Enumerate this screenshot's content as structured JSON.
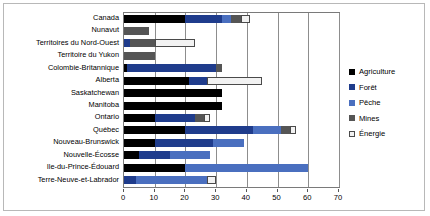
{
  "chart_data": {
    "type": "bar",
    "orientation": "horizontal",
    "stacked": true,
    "title": "",
    "xlabel": "",
    "ylabel": "",
    "xlim": [
      0,
      70
    ],
    "xticks": [
      0,
      10,
      20,
      30,
      40,
      50,
      60,
      70
    ],
    "grid": true,
    "legend_position": "right",
    "categories": [
      "Canada",
      "Nunavut",
      "Territoires du Nord-Ouest",
      "Territoire du Yukon",
      "Colombie-Britannique",
      "Alberta",
      "Saskatchewan",
      "Manitoba",
      "Ontario",
      "Québec",
      "Nouveau-Brunswick",
      "Nouvelle-Écosse",
      "Ile-du-Prince-Édouard",
      "Terre-Neuve-et-Labrador"
    ],
    "series": [
      {
        "name": "Agriculture",
        "color": "#000000",
        "values": [
          20,
          0,
          0,
          0,
          1,
          21,
          32,
          32,
          10,
          20,
          10,
          5,
          20,
          0
        ]
      },
      {
        "name": "Forêt",
        "color": "#1f3c8c",
        "values": [
          12,
          0,
          2,
          0,
          29,
          6,
          0,
          0,
          13,
          22,
          19,
          10,
          0,
          4
        ]
      },
      {
        "name": "Pêche",
        "color": "#4a6fbf",
        "values": [
          3,
          0,
          0,
          0,
          0,
          0,
          0,
          0,
          0,
          9,
          10,
          13,
          40,
          23
        ]
      },
      {
        "name": "Mines",
        "color": "#555555",
        "values": [
          3,
          8,
          8,
          10,
          2,
          0,
          0,
          0,
          3,
          3,
          0,
          0,
          0,
          0
        ]
      },
      {
        "name": "Énergie",
        "color": "#f2f2f2",
        "values": [
          3,
          0,
          13,
          0,
          0,
          18,
          0,
          0,
          2,
          2,
          0,
          0,
          0,
          3
        ]
      }
    ],
    "legend": [
      {
        "label": "Agriculture",
        "color": "#000000",
        "swatch": "filled"
      },
      {
        "label": "Forêt",
        "color": "#1f3c8c",
        "swatch": "filled"
      },
      {
        "label": "Pêche",
        "color": "#4a6fbf",
        "swatch": "filled"
      },
      {
        "label": "Mines",
        "color": "#555555",
        "swatch": "filled"
      },
      {
        "label": "Énergie",
        "color": "#f2f2f2",
        "swatch": "outlined"
      }
    ]
  }
}
